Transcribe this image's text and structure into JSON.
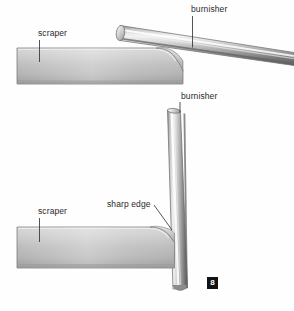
{
  "figure": {
    "badge": "8",
    "background_color": "#fefefe",
    "line_color": "#2a2a2a",
    "metal_light": "#f2f2f2",
    "metal_mid": "#b9b9b9",
    "metal_dark": "#6f6f6f",
    "metal_shadow": "#4a4a4a"
  },
  "panels": {
    "top": {
      "name": "burnisher-angled-on-scraper",
      "labels": {
        "burnisher": "burnisher",
        "scraper": "scraper"
      }
    },
    "bottom": {
      "name": "burnisher-vertical-on-scraper",
      "labels": {
        "burnisher": "burnisher",
        "scraper": "scraper",
        "sharp_edge": "sharp edge"
      }
    }
  }
}
